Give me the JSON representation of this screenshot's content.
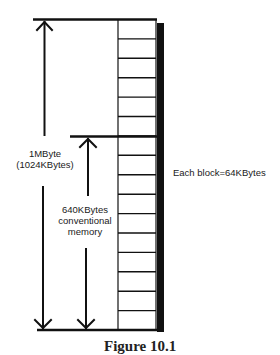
{
  "diagram": {
    "total_label_line1": "1MByte",
    "total_label_line2": "(1024KBytes)",
    "conventional_label_line1": "640KBytes",
    "conventional_label_line2": "conventional",
    "conventional_label_line3": "memory",
    "block_note": "Each block=64KBytes",
    "caption": "Figure 10.1",
    "block_count": 16,
    "block_size_kb": 64,
    "total_kb": 1024,
    "conventional_kb": 640,
    "conventional_blocks": 10,
    "colors": {
      "line": "#111111",
      "shadow": "#111111",
      "background": "#ffffff"
    }
  }
}
